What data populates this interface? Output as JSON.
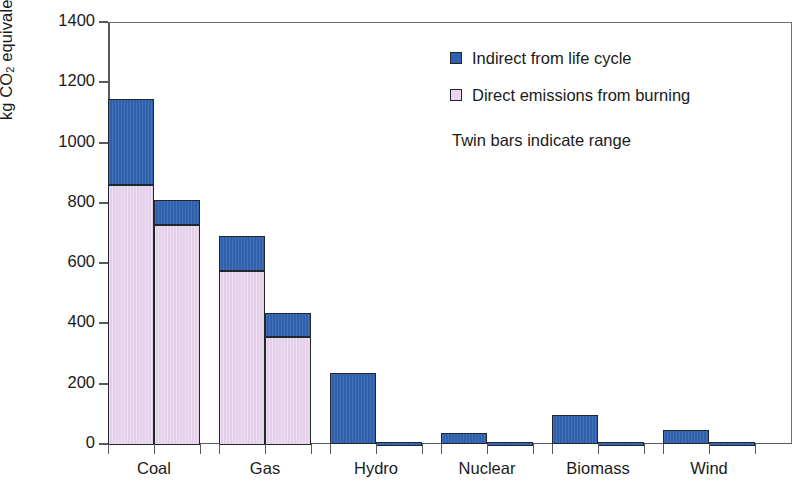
{
  "axis": {
    "y_label_parts": {
      "pre": "kg CO",
      "sub": "2",
      "mid": " equivalent MWh",
      "sup": "−1"
    },
    "y_ticks": [
      "0",
      "200",
      "400",
      "600",
      "800",
      "1000",
      "1200",
      "1400"
    ]
  },
  "legend": {
    "indirect": "Indirect from life cycle",
    "direct": "Direct emissions from burning",
    "note": "Twin bars indicate range"
  },
  "colors": {
    "indirect": "#2f60ad",
    "direct": "#e3cfe9",
    "axis": "#555a5e",
    "outline": "#23262b"
  },
  "chart_data": {
    "type": "bar",
    "title": "",
    "xlabel": "",
    "ylabel": "kg CO2 equivalent MWh-1",
    "ylim": [
      0,
      1400
    ],
    "ytick_step": 200,
    "grid": false,
    "stacked": true,
    "twin_bars": true,
    "legend_position": "inside-top-right",
    "categories": [
      "Coal",
      "Gas",
      "Hydro",
      "Nuclear",
      "Biomass",
      "Wind"
    ],
    "series": [
      {
        "name": "Direct emissions from burning",
        "values_low": [
          725,
          355,
          0,
          0,
          0,
          0
        ],
        "values_high": [
          860,
          575,
          0,
          0,
          0,
          0
        ]
      },
      {
        "name": "Indirect from life cycle",
        "values_low": [
          85,
          80,
          8,
          8,
          6,
          6
        ],
        "values_high": [
          285,
          115,
          235,
          35,
          95,
          48
        ]
      }
    ],
    "bars": [
      {
        "category": "Coal",
        "variant": "high",
        "direct": 860,
        "indirect": 285,
        "total": 1145
      },
      {
        "category": "Coal",
        "variant": "low",
        "direct": 725,
        "indirect": 85,
        "total": 810
      },
      {
        "category": "Gas",
        "variant": "high",
        "direct": 575,
        "indirect": 115,
        "total": 690
      },
      {
        "category": "Gas",
        "variant": "low",
        "direct": 355,
        "indirect": 80,
        "total": 435
      },
      {
        "category": "Hydro",
        "variant": "high",
        "direct": 0,
        "indirect": 235,
        "total": 235
      },
      {
        "category": "Hydro",
        "variant": "low",
        "direct": 0,
        "indirect": 8,
        "total": 8
      },
      {
        "category": "Nuclear",
        "variant": "high",
        "direct": 0,
        "indirect": 35,
        "total": 35
      },
      {
        "category": "Nuclear",
        "variant": "low",
        "direct": 0,
        "indirect": 8,
        "total": 8
      },
      {
        "category": "Biomass",
        "variant": "high",
        "direct": 0,
        "indirect": 95,
        "total": 95
      },
      {
        "category": "Biomass",
        "variant": "low",
        "direct": 0,
        "indirect": 6,
        "total": 6
      },
      {
        "category": "Wind",
        "variant": "high",
        "direct": 0,
        "indirect": 48,
        "total": 48
      },
      {
        "category": "Wind",
        "variant": "low",
        "direct": 0,
        "indirect": 6,
        "total": 6
      }
    ]
  }
}
